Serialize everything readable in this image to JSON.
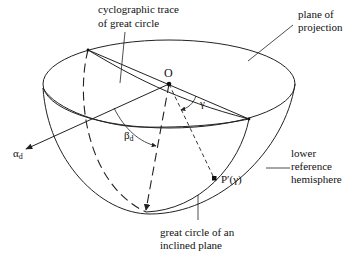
{
  "labels": {
    "trace_line1": "cyclographic trace",
    "trace_line2": "of great circle",
    "plane_line1": "plane of",
    "plane_line2": "projection",
    "origin": "O",
    "gamma": "γ",
    "alpha_d": "α",
    "alpha_sub": "d",
    "beta_d": "β",
    "beta_sub": "d",
    "point": "P′(γ)",
    "hemi_line1": "lower",
    "hemi_line2": "reference",
    "hemi_line3": "hemisphere",
    "gc_line1": "great circle of an",
    "gc_line2": "inclined plane"
  },
  "colors": {
    "ink": "#222222",
    "background": "#ffffff"
  }
}
